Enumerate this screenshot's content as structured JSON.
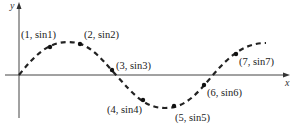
{
  "diagram": {
    "axes": {
      "x_label": "x",
      "y_label": "y"
    },
    "points": [
      {
        "label": "(1, sin1)",
        "x": 1
      },
      {
        "label": "(2, sin2)",
        "x": 2
      },
      {
        "label": "(3, sin3)",
        "x": 3
      },
      {
        "label": "(4, sin4)",
        "x": 4
      },
      {
        "label": "(5, sin5)",
        "x": 5
      },
      {
        "label": "(6, sin6)",
        "x": 6
      },
      {
        "label": "(7, sin7)",
        "x": 7
      }
    ],
    "curve": {
      "function": "y = sin x",
      "style": "dashed",
      "color": "#222222"
    }
  }
}
